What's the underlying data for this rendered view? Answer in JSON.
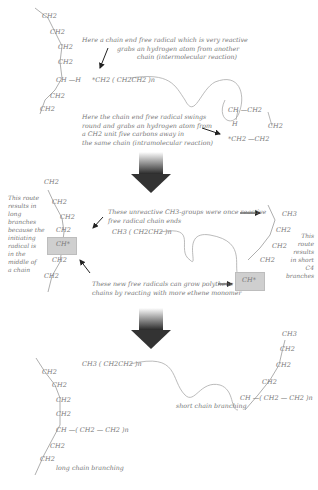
{
  "panel1": {
    "chain_left": [
      "CH2",
      "CH2",
      "CH2",
      "CH2",
      "CH —H",
      "CH2",
      "CH2"
    ],
    "radical_chain": "*CH2 ( CH2CH2 )n",
    "note_intermolecular": [
      "Here a chain end free radical which is very reactive",
      "grabs an hydrogen atom from another",
      "chain (intermolecular reaction)"
    ],
    "note_intramolecular": [
      "Here the chain end free radical swings",
      "round and grabs an hydrogen atom from",
      "a CH2 unit five carbons away in",
      "the same chain (intramolecular reaction)"
    ],
    "ring": {
      "top": "CH —CH2",
      "h": "H",
      "right": "CH2",
      "bottom": "*CH2 —CH2"
    }
  },
  "panel2": {
    "chain_left": [
      "CH2",
      "CH2",
      "CH2",
      "CH2",
      "CH*",
      "CH2",
      "CH2"
    ],
    "note_long": [
      "This route",
      "results in",
      "long branches",
      "because the",
      "initiating",
      "radical is",
      "in the",
      "middle of",
      "a chain"
    ],
    "note_unreactive": [
      "These unreactive CH3-groups were once reactive",
      "free radical chain ends"
    ],
    "note_grow": [
      "These new free radicals can grow polythene",
      "chains by reacting with more ethene monomer"
    ],
    "dead_chain": "CH3 ( CH2CH2 )n",
    "short_branch": [
      "CH3",
      "CH2",
      "CH2",
      "CH2",
      "CH*"
    ],
    "note_short": [
      "This",
      "route",
      "results",
      "in short",
      "C4 branches"
    ]
  },
  "panel3": {
    "dead_chain": "CH3 ( CH2CH2 )n",
    "long_chain": [
      "CH2",
      "CH2",
      "CH2",
      "CH2",
      "CH —( CH2 — CH2 )n",
      "CH2",
      "CH2"
    ],
    "long_label": "long chain branching",
    "short_branch": [
      "CH3",
      "CH2",
      "CH2",
      "CH2",
      "CH —( CH2 — CH2 )n"
    ],
    "short_label": "short chain branching"
  },
  "colors": {
    "text": "#777777",
    "arrow": "#333333",
    "highlight": "#cfcfcf"
  }
}
